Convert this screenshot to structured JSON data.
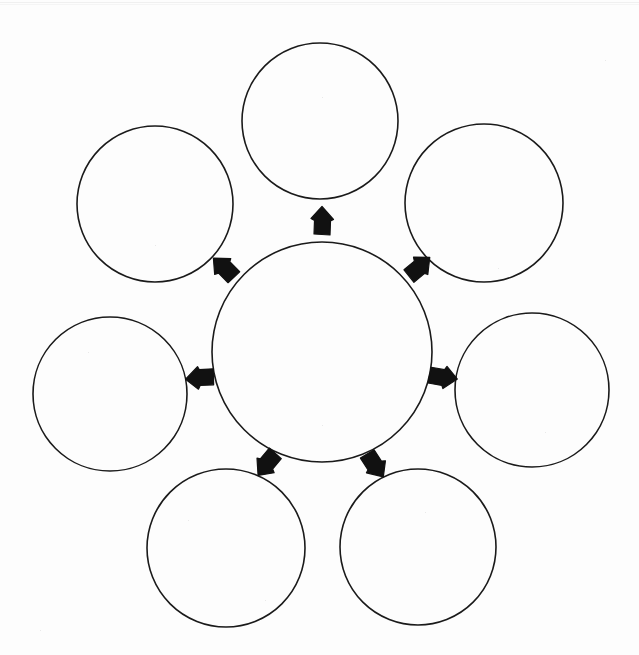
{
  "page": {
    "background_color": "#fdfdfd",
    "stroke_color": "#1a1a1a",
    "arrow_fill_color": "#111111",
    "width": 639,
    "height": 655
  },
  "diagram": {
    "type": "hub-and-spoke-blank-organizer",
    "center": {
      "name": "center-circle",
      "label": "",
      "cx": 322,
      "cy": 352,
      "r": 110,
      "stroke_width": 1.6
    },
    "satellites": [
      {
        "name": "circle-top",
        "position": "top",
        "label": "",
        "cx": 320,
        "cy": 121,
        "r": 78,
        "stroke_width": 1.6
      },
      {
        "name": "circle-upper-right",
        "position": "upper-right",
        "label": "",
        "cx": 484,
        "cy": 203,
        "r": 79,
        "stroke_width": 1.6
      },
      {
        "name": "circle-right",
        "position": "right",
        "label": "",
        "cx": 532,
        "cy": 390,
        "r": 77,
        "stroke_width": 1.6
      },
      {
        "name": "circle-lower-right",
        "position": "lower-right",
        "label": "",
        "cx": 418,
        "cy": 547,
        "r": 78,
        "stroke_width": 1.6
      },
      {
        "name": "circle-lower-left",
        "position": "lower-left",
        "label": "",
        "cx": 226,
        "cy": 548,
        "r": 79,
        "stroke_width": 1.6
      },
      {
        "name": "circle-left",
        "position": "left",
        "label": "",
        "cx": 110,
        "cy": 394,
        "r": 77,
        "stroke_width": 1.6
      },
      {
        "name": "circle-upper-left",
        "position": "upper-left",
        "label": "",
        "cx": 155,
        "cy": 204,
        "r": 78,
        "stroke_width": 1.6
      }
    ],
    "arrows": [
      {
        "name": "arrow-to-top",
        "points_to": "circle-top",
        "cx": 322,
        "cy": 221,
        "angle": -90,
        "size": 30
      },
      {
        "name": "arrow-to-upper-right",
        "points_to": "circle-upper-right",
        "cx": 419,
        "cy": 267,
        "angle": -42,
        "size": 30
      },
      {
        "name": "arrow-to-right",
        "points_to": "circle-right",
        "cx": 443,
        "cy": 377,
        "angle": 8,
        "size": 30
      },
      {
        "name": "arrow-to-lower-right",
        "points_to": "circle-lower-right",
        "cx": 375,
        "cy": 465,
        "angle": 55,
        "size": 30
      },
      {
        "name": "arrow-to-lower-left",
        "points_to": "circle-lower-left",
        "cx": 267,
        "cy": 464,
        "angle": 128,
        "size": 30
      },
      {
        "name": "arrow-to-left",
        "points_to": "circle-left",
        "cx": 200,
        "cy": 378,
        "angle": 175,
        "size": 30
      },
      {
        "name": "arrow-to-upper-left",
        "points_to": "circle-upper-left",
        "cx": 224,
        "cy": 268,
        "angle": -137,
        "size": 30
      }
    ],
    "specks": [
      {
        "x": 155,
        "y": 245
      },
      {
        "x": 322,
        "y": 97
      },
      {
        "x": 498,
        "y": 268
      },
      {
        "x": 188,
        "y": 520
      },
      {
        "x": 425,
        "y": 512
      },
      {
        "x": 322,
        "y": 425
      },
      {
        "x": 88,
        "y": 352
      },
      {
        "x": 545,
        "y": 432
      },
      {
        "x": 265,
        "y": 600
      },
      {
        "x": 605,
        "y": 60
      },
      {
        "x": 40,
        "y": 630
      }
    ]
  }
}
